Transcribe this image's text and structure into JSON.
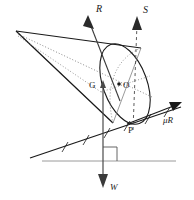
{
  "figure": {
    "domain": "mechanics-diagram",
    "background_color": "#ffffff",
    "stroke_color": "#1a1a1a",
    "faint_stroke_color": "#8a8a8a",
    "labels": {
      "reaction_force": "R",
      "applied_force": "S",
      "friction_force": "μR",
      "weight": "W",
      "centroid": "G",
      "base_center": "O",
      "contact_point": "P"
    },
    "geometry": {
      "cone_apex": [
        16,
        31
      ],
      "base_center": [
        125,
        84
      ],
      "centroid": [
        98,
        85
      ],
      "contact_point": [
        127,
        124
      ],
      "incline_left": [
        30,
        158
      ],
      "incline_right": [
        181,
        107
      ],
      "ground_left": [
        42,
        161
      ],
      "ground_right": [
        176,
        161
      ]
    },
    "vectors": [
      {
        "name": "R",
        "label": "R",
        "from": [
          118,
          99
        ],
        "to": [
          88,
          18
        ],
        "style": "solid"
      },
      {
        "name": "S",
        "label": "S",
        "from": [
          133,
          128
        ],
        "to": [
          137,
          19
        ],
        "style": "dashed"
      },
      {
        "name": "muR",
        "label": "μR",
        "from": [
          127,
          124
        ],
        "to": [
          178,
          103
        ],
        "style": "solid"
      },
      {
        "name": "W",
        "label": "W",
        "from": [
          103,
          84
        ],
        "to": [
          103,
          186
        ],
        "style": "solid"
      }
    ],
    "annotations": {
      "right_angle_marker": true,
      "hatch_marks_on_incline": 6,
      "ground_line": true
    }
  }
}
